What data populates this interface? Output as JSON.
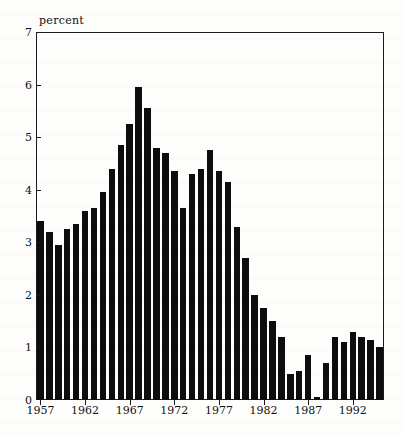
{
  "chart_data": {
    "type": "bar",
    "title": "",
    "xlabel": "",
    "ylabel": "percent",
    "ylim": [
      0,
      7
    ],
    "xlim": [
      1956.5,
      1995.5
    ],
    "grid": false,
    "legend": null,
    "ytick_labels": [
      "0",
      "1",
      "2",
      "3",
      "4",
      "5",
      "6",
      "7"
    ],
    "ytick_values": [
      0,
      1,
      2,
      3,
      4,
      5,
      6,
      7
    ],
    "xtick_labels": [
      "1957",
      "1962",
      "1967",
      "1972",
      "1977",
      "1982",
      "1987",
      "1992"
    ],
    "xtick_values": [
      1957,
      1962,
      1967,
      1972,
      1977,
      1982,
      1987,
      1992
    ],
    "categories": [
      "1957",
      "1958",
      "1959",
      "1960",
      "1961",
      "1962",
      "1963",
      "1964",
      "1965",
      "1966",
      "1967",
      "1968",
      "1969",
      "1970",
      "1971",
      "1972",
      "1973",
      "1974",
      "1975",
      "1976",
      "1977",
      "1978",
      "1979",
      "1980",
      "1981",
      "1982",
      "1983",
      "1984",
      "1985",
      "1986",
      "1987",
      "1988",
      "1989",
      "1990",
      "1991",
      "1992",
      "1993",
      "1994",
      "1995"
    ],
    "values": [
      3.4,
      3.2,
      2.95,
      3.25,
      3.35,
      3.6,
      3.65,
      3.95,
      4.4,
      4.85,
      5.25,
      5.95,
      5.55,
      4.8,
      4.7,
      4.35,
      3.65,
      4.3,
      4.4,
      4.75,
      4.35,
      4.15,
      3.3,
      2.7,
      2.0,
      1.75,
      1.5,
      1.2,
      0.5,
      0.55,
      0.85,
      0.05,
      0.7,
      1.2,
      1.1,
      1.3,
      1.2,
      1.15,
      1.0
    ],
    "value_unit": "percent",
    "bar_color": "#0d0d0d",
    "axis_color": "#1a1a1a",
    "background_color": "#fdfdfb"
  }
}
